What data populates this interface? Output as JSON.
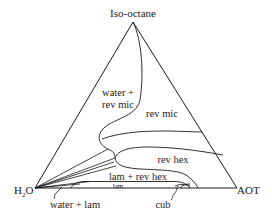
{
  "diagram": {
    "type": "ternary phase diagram",
    "vertices": {
      "top": "Iso-octane",
      "bottom_left": "H2O",
      "bottom_left_main": "H",
      "bottom_left_sub": "2",
      "bottom_left_tail": "O",
      "bottom_right": "AOT"
    },
    "regions": {
      "water_rev_mic_line1": "water +",
      "water_rev_mic_line2": "rev mic",
      "rev_mic": "rev mic",
      "rev_hex": "rev hex",
      "lam_rev_hex": "lam + rev hex",
      "lam": "lam"
    },
    "callouts": {
      "water_lam": "water + lam",
      "cub": "cub"
    },
    "colors": {
      "line": "#1a1a1a",
      "background": "#ffffff"
    }
  }
}
